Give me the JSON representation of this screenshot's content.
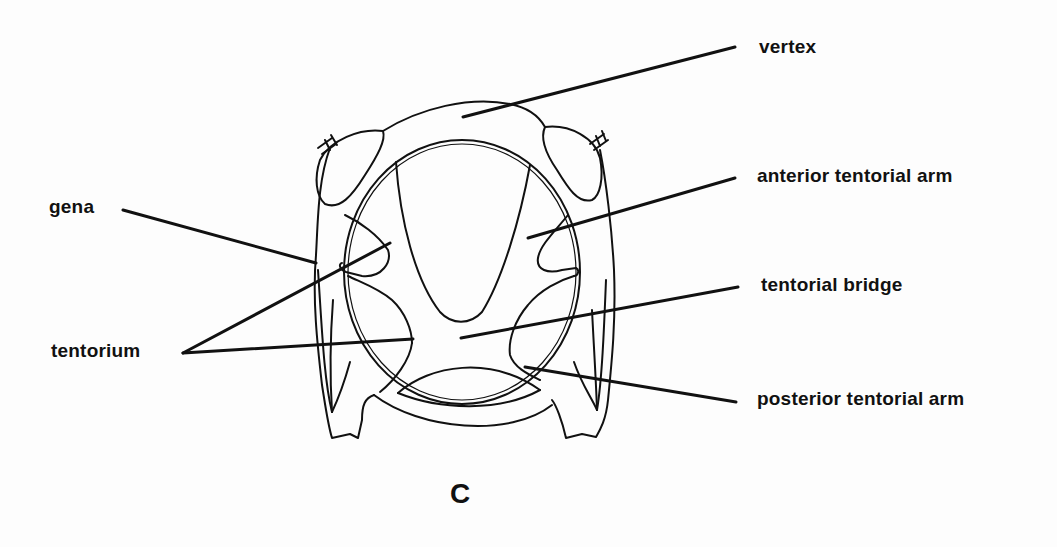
{
  "figure": {
    "panel_label": "C"
  },
  "labels": {
    "vertex": "vertex",
    "anterior_tentorial_arm": "anterior tentorial arm",
    "gena": "gena",
    "tentorial_bridge": "tentorial bridge",
    "tentorium": "tentorium",
    "posterior_tentorial_arm": "posterior tentorial arm"
  },
  "colors": {
    "ink": "#111111",
    "background": "#fdfdfd"
  }
}
